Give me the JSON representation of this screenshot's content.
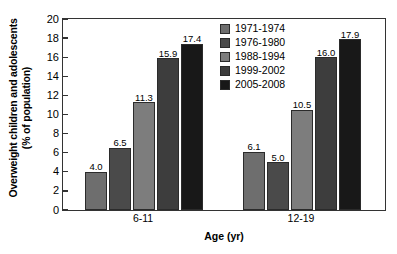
{
  "chart_data": {
    "type": "bar",
    "title": "",
    "xlabel": "Age (yr)",
    "ylabel": "Overweight children and adolescents\n(% of population)",
    "ylabel_line1": "Overweight children and adolescents",
    "ylabel_line2": "(% of population)",
    "categories": [
      "6-11",
      "12-19"
    ],
    "ylim": [
      0,
      20
    ],
    "yticks": [
      0,
      2,
      4,
      6,
      8,
      10,
      12,
      14,
      16,
      18,
      20
    ],
    "ytick_labels": [
      "0",
      "2",
      "4",
      "6",
      "8",
      "10",
      "12",
      "14",
      "16",
      "18",
      "20"
    ],
    "grid": false,
    "legend_position": "top-center",
    "series": [
      {
        "name": "1971-1974",
        "color": "#6e6e6e",
        "values": [
          4.0,
          6.1
        ],
        "labels": [
          "4.0",
          "6.1"
        ]
      },
      {
        "name": "1976-1980",
        "color": "#4a4a4a",
        "values": [
          6.5,
          5.0
        ],
        "labels": [
          "6.5",
          "5.0"
        ]
      },
      {
        "name": "1988-1994",
        "color": "#7d7d7d",
        "values": [
          11.3,
          10.5
        ],
        "labels": [
          "11.3",
          "10.5"
        ]
      },
      {
        "name": "1999-2002",
        "color": "#3d3d3d",
        "values": [
          15.9,
          16.0
        ],
        "labels": [
          "15.9",
          "16.0"
        ]
      },
      {
        "name": "2005-2008",
        "color": "#181818",
        "values": [
          17.4,
          17.9
        ],
        "labels": [
          "17.4",
          "17.9"
        ]
      }
    ]
  }
}
